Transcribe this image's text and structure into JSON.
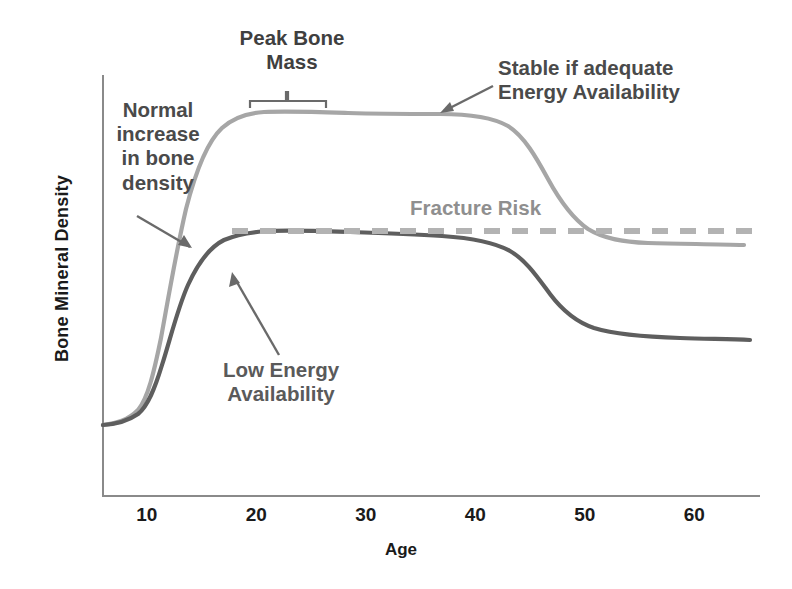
{
  "chart_data": {
    "type": "line",
    "title": "",
    "xlabel": "Age",
    "ylabel": "Bone Mineral Density",
    "xlim": [
      6,
      66
    ],
    "ylim": [
      0,
      1
    ],
    "grid": false,
    "legend_position": "none",
    "xticks": [
      "10",
      "20",
      "30",
      "40",
      "50",
      "60"
    ],
    "xtick_values": [
      10,
      20,
      30,
      40,
      50,
      60
    ],
    "yticks": [],
    "series": [
      {
        "name": "Normal bone mineral density",
        "color": "#a6a6a6",
        "style": "solid",
        "x": [
          6,
          8,
          10,
          11,
          12,
          13,
          14,
          15,
          16,
          17,
          18,
          20,
          22,
          25,
          28,
          30,
          33,
          36,
          38,
          40,
          43,
          45,
          47,
          48,
          50,
          52,
          54,
          56,
          58,
          60,
          62,
          64,
          66
        ],
        "y": [
          0.17,
          0.18,
          0.21,
          0.25,
          0.33,
          0.46,
          0.61,
          0.72,
          0.79,
          0.83,
          0.855,
          0.875,
          0.882,
          0.884,
          0.883,
          0.881,
          0.878,
          0.876,
          0.877,
          0.876,
          0.872,
          0.866,
          0.852,
          0.84,
          0.795,
          0.73,
          0.665,
          0.615,
          0.575,
          0.545,
          0.52,
          0.5,
          0.488
        ]
      },
      {
        "name": "Low energy availability bone mineral density",
        "color": "#5e5e5e",
        "style": "solid",
        "x": [
          6,
          8,
          10,
          11,
          12,
          13,
          14,
          15,
          16,
          17,
          18,
          20,
          22,
          25,
          28,
          30,
          33,
          36,
          38,
          40,
          43,
          45,
          47,
          48,
          50,
          52,
          54,
          56,
          58,
          60,
          62,
          64,
          66
        ],
        "y": [
          0.17,
          0.18,
          0.205,
          0.235,
          0.295,
          0.39,
          0.485,
          0.56,
          0.605,
          0.63,
          0.645,
          0.655,
          0.658,
          0.657,
          0.652,
          0.648,
          0.643,
          0.639,
          0.636,
          0.633,
          0.626,
          0.618,
          0.602,
          0.59,
          0.558,
          0.52,
          0.478,
          0.44,
          0.41,
          0.385,
          0.36,
          0.34,
          0.325
        ]
      }
    ],
    "threshold_line": {
      "name": "Fracture Risk",
      "label": "Fracture Risk",
      "color": "#b3b3b3",
      "style": "dashed",
      "y": 0.675,
      "x_start": 18,
      "x_end": 67
    },
    "annotations": [
      {
        "id": "peak-bone-mass",
        "text": "Peak Bone\nMass",
        "color": "#3f3f3f",
        "bracket": {
          "x_start": 20,
          "x_end": 28
        }
      },
      {
        "id": "normal-increase",
        "text": "Normal\nincrease\nin bone\ndensity",
        "color": "#4a4a4a",
        "arrow": {
          "from_x": 11,
          "from_y": 0.55,
          "to_x": 14.3,
          "to_y": 0.44
        }
      },
      {
        "id": "stable-if-adequate",
        "text": "Stable if adequate\nEnergy Availability",
        "color": "#4a4a4a",
        "arrow": {
          "from_x": 42.5,
          "from_y": 0.92,
          "to_x": 37.5,
          "to_y": 0.87
        }
      },
      {
        "id": "low-energy-availability",
        "text": "Low Energy\nAvailability",
        "color": "#5a5a5a",
        "arrow": {
          "from_x": 22.4,
          "from_y": 0.355,
          "to_x": 18.1,
          "to_y": 0.555
        }
      }
    ]
  },
  "axis": {
    "ylabel": "Bone Mineral Density",
    "xlabel": "Age",
    "xticks": [
      "10",
      "20",
      "30",
      "40",
      "50",
      "60"
    ]
  },
  "labels": {
    "peak_bone_mass": "Peak Bone\nMass",
    "normal_increase": "Normal\nincrease\nin bone\ndensity",
    "stable_if_adequate": "Stable if adequate\nEnergy Availability",
    "fracture_risk": "Fracture Risk",
    "low_energy_availability": "Low Energy\nAvailability"
  },
  "colors": {
    "normal_curve": "#a6a6a6",
    "low_energy_curve": "#5e5e5e",
    "fracture_line": "#b3b3b3",
    "axis": "#808080",
    "text_dark": "#1a1a1a",
    "text_gray": "#4a4a4a",
    "text_light_gray": "#8f8f8f"
  }
}
